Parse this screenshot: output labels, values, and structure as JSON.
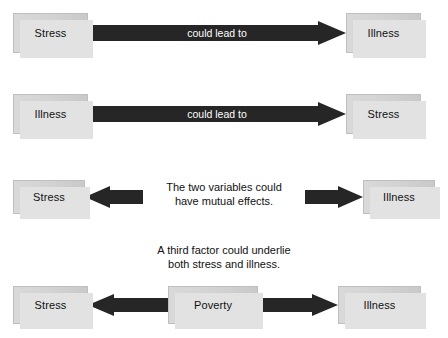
{
  "figure": {
    "background": "#ffffff",
    "box_fill_light": "#d9d9d9",
    "box_fill_dark": "#c9c9c9",
    "box_shadow": "#e2e2e2",
    "arrow_fill": "#262626",
    "arrow_label_color": "#ffffff",
    "text_color": "#111111"
  },
  "rows": [
    {
      "id": "row-1",
      "meaning": "Stress could lead to illness",
      "left_box": "Stress",
      "right_box": "Illness",
      "arrow_label": "could lead to",
      "arrow_direction": "right"
    },
    {
      "id": "row-2",
      "meaning": "Illness could lead to stress",
      "left_box": "Illness",
      "right_box": "Stress",
      "arrow_label": "could lead to",
      "arrow_direction": "right"
    },
    {
      "id": "row-3",
      "meaning": "Mutual effects",
      "left_box": "Stress",
      "right_box": "Illness",
      "center_caption_line1": "The two variables could",
      "center_caption_line2": "have mutual effects.",
      "left_arrow_direction": "left",
      "right_arrow_direction": "right"
    },
    {
      "id": "row-4",
      "meaning": "A third factor underlies both",
      "left_box": "Stress",
      "center_box": "Poverty",
      "right_box": "Illness",
      "caption_line1": "A third factor could underlie",
      "caption_line2": "both stress and illness.",
      "left_arrow_direction": "left",
      "right_arrow_direction": "right"
    }
  ]
}
